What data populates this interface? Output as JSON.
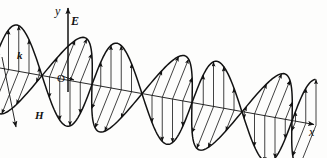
{
  "figure": {
    "background_color": "#fdfdfc",
    "ink_color": "#121212"
  },
  "labels": {
    "y_axis": "y",
    "x_axis": "x",
    "e_field": "E",
    "h_field": "H",
    "wave_vector": "k",
    "origin": "O"
  },
  "axes": {
    "x": {
      "from": [
        0,
        68
      ],
      "to": [
        320,
        126
      ],
      "arrow": true,
      "label": "x"
    },
    "y": {
      "from": [
        68,
        90
      ],
      "to": [
        68,
        4
      ],
      "arrow": true,
      "label": "y"
    },
    "k": {
      "from": [
        2,
        57
      ],
      "to": [
        17,
        131
      ],
      "arrow_end": true,
      "label_start": "k",
      "label_end": "H"
    }
  },
  "chart_data": {
    "type": "line",
    "xlabel": "x",
    "ylabel": "y",
    "series": [
      {
        "name": "E",
        "description": "Electric field, transverse sinusoid in the vertical (x-y) plane",
        "color": "#121212",
        "amplitude_px": 46,
        "wavelength_px": 100,
        "phase_deg": 0,
        "n_arrows": 32,
        "arrow_style": "vertical-solid-head"
      },
      {
        "name": "H",
        "description": "Magnetic field, transverse sinusoid in the plane containing k, perpendicular to E",
        "color": "#121212",
        "amplitude_px": 46,
        "wavelength_px": 100,
        "phase_deg": 0,
        "n_arrows": 32,
        "arrow_style": "oblique-solid-head",
        "oblique_dx": -20,
        "oblique_dy": 50
      }
    ],
    "x_range_px": [
      -12,
      316
    ],
    "cycles": 3.3,
    "grid": false,
    "legend": false,
    "annotations": [
      "y",
      "E",
      "k",
      "O",
      "H",
      "x"
    ]
  }
}
